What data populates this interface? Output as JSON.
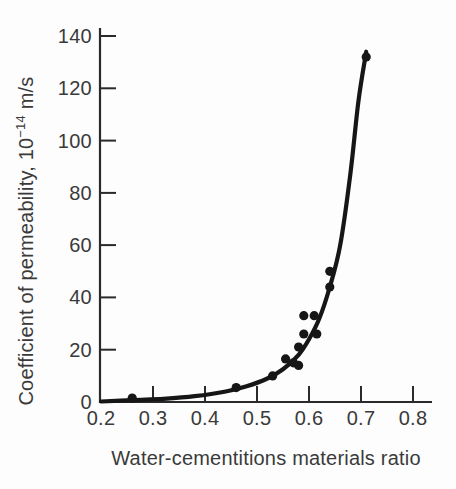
{
  "chart_data": {
    "type": "scatter",
    "title": "",
    "xlabel": "Water-cementitions materials ratio",
    "ylabel": "Coefficient of permeability, 10⁻¹⁴ m/s",
    "ylabel_prefix": "Coefficient of permeability, 10",
    "ylabel_exponent": "−14",
    "ylabel_suffix": " m/s",
    "xlim": [
      0.2,
      0.8
    ],
    "ylim": [
      0,
      140
    ],
    "x_ticks": [
      0.2,
      0.3,
      0.4,
      0.5,
      0.6,
      0.7,
      0.8
    ],
    "x_tick_labels": [
      "0.2",
      "0.3",
      "0.4",
      "0.5",
      "0.6",
      "0.7",
      "0.8"
    ],
    "y_ticks": [
      0,
      20,
      40,
      60,
      80,
      100,
      120,
      140
    ],
    "y_tick_labels": [
      "0",
      "20",
      "40",
      "60",
      "80",
      "100",
      "120",
      "140"
    ],
    "grid": false,
    "legend": false,
    "marker": "filled-circle",
    "points": [
      [
        0.26,
        1.5
      ],
      [
        0.46,
        5.5
      ],
      [
        0.53,
        10
      ],
      [
        0.555,
        16.5
      ],
      [
        0.57,
        15
      ],
      [
        0.58,
        14
      ],
      [
        0.58,
        21
      ],
      [
        0.59,
        26
      ],
      [
        0.59,
        33
      ],
      [
        0.61,
        33
      ],
      [
        0.615,
        26
      ],
      [
        0.64,
        44
      ],
      [
        0.64,
        50
      ],
      [
        0.71,
        132
      ]
    ],
    "curve": [
      [
        0.2,
        0.2
      ],
      [
        0.26,
        0.7
      ],
      [
        0.32,
        1.2
      ],
      [
        0.38,
        2.2
      ],
      [
        0.44,
        4.0
      ],
      [
        0.48,
        6.0
      ],
      [
        0.52,
        9.0
      ],
      [
        0.55,
        12.5
      ],
      [
        0.58,
        18
      ],
      [
        0.6,
        24
      ],
      [
        0.62,
        32
      ],
      [
        0.64,
        44
      ],
      [
        0.66,
        60
      ],
      [
        0.68,
        88
      ],
      [
        0.695,
        115
      ],
      [
        0.71,
        134
      ]
    ],
    "colors": {
      "ink": "#161616",
      "axis": "#2a2a2a",
      "text": "#3a3a3a",
      "background": "#fdfdfd"
    }
  }
}
